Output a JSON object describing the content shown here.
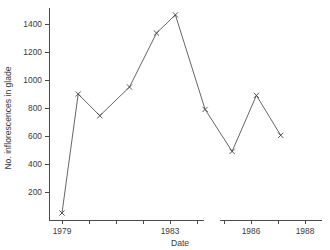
{
  "chart_data": {
    "type": "line",
    "title": "",
    "xlabel": "Date",
    "ylabel": "No. inflorescences in glade",
    "ylim": [
      0,
      1520
    ],
    "yticks": [
      200,
      400,
      600,
      800,
      1000,
      1200,
      1400
    ],
    "ytick_labels": [
      "200",
      "400",
      "600",
      "800",
      "1000",
      "1200",
      "1400"
    ],
    "xlim": [
      1978.6,
      1988.4
    ],
    "xticks": [
      1979,
      1980,
      1981,
      1982,
      1983,
      1984,
      1985,
      1986,
      1987,
      1988
    ],
    "xtick_labels": [
      "1979",
      "1983",
      "1986",
      "1988"
    ],
    "xtick_label_values": [
      1979,
      1983,
      1986,
      1988
    ],
    "grid": false,
    "legend": "none",
    "marker": "x",
    "axis_break": {
      "present": true,
      "from": 1984.25,
      "to": 1984.85
    },
    "series": [
      {
        "name": "No. inflorescences in glade",
        "x": [
          1979,
          1979.6,
          1980.4,
          1981.5,
          1982.5,
          1983.2,
          1984.3,
          1985.3,
          1986.2,
          1987.1
        ],
        "values": [
          50,
          900,
          745,
          950,
          1335,
          1465,
          790,
          490,
          890,
          605
        ],
        "color": "#555555"
      }
    ]
  },
  "axis_titles": {
    "x": "Date",
    "y": "No. inflorescences in glade"
  }
}
